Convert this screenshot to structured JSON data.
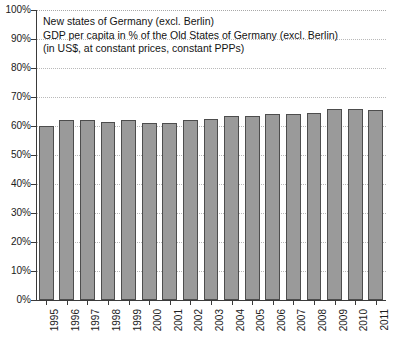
{
  "chart_data": {
    "type": "bar",
    "title": "New states of Germany (excl. Berlin)",
    "subtitle": "GDP per capita in % of the Old States of Germany (excl. Berlin)",
    "note": "(in US$, at constant prices, constant PPPs)",
    "title_lines": [
      "New states of Germany (excl. Berlin)",
      "GDP per capita in % of the Old States of Germany (excl. Berlin)",
      "(in US$, at constant prices, constant PPPs)"
    ],
    "xlabel": "",
    "ylabel": "",
    "ylim": [
      0,
      100
    ],
    "grid": true,
    "legend": "none",
    "bar_color": "#9a9a9a",
    "bar_edge_color": "#4d4d4d",
    "categories": [
      "1995",
      "1996",
      "1997",
      "1998",
      "1999",
      "2000",
      "2001",
      "2002",
      "2003",
      "2004",
      "2005",
      "2006",
      "2007",
      "2008",
      "2009",
      "2010",
      "2011"
    ],
    "values": [
      60,
      62,
      62,
      61.5,
      62,
      61,
      61,
      62,
      62.5,
      63.5,
      63.5,
      64,
      64,
      64.5,
      66,
      66,
      65.5
    ],
    "ytick_labels": [
      "100%",
      "90%",
      "80%",
      "70%",
      "60%",
      "50%",
      "40%",
      "30%",
      "20%",
      "10%",
      "0%"
    ],
    "ytick_values": [
      100,
      90,
      80,
      70,
      60,
      50,
      40,
      30,
      20,
      10,
      0
    ]
  }
}
